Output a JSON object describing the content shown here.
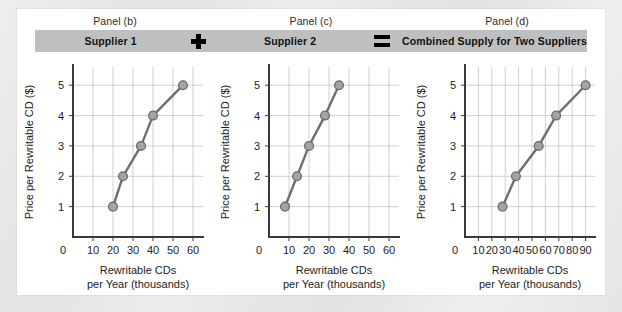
{
  "figure": {
    "panel_captions": [
      "Panel (b)",
      "Panel (c)",
      "Panel (d)"
    ],
    "title_bar": {
      "supplier1_label": "Supplier 1",
      "plus_operator": "+",
      "supplier2_label": "Supplier 2",
      "equals_operator": "=",
      "combined_label": "Combined Supply for Two Suppliers",
      "bar_color": "#bfbfbf"
    },
    "colors": {
      "line": "#6f6f6f",
      "marker_fill": "#a3a3a3",
      "marker_stroke": "#6b6b6b",
      "grid": "#c4c4c4",
      "axis": "#3a3a3a",
      "card_background": "#ffffff",
      "page_background": "#e8e8e8"
    }
  },
  "chart_data": [
    {
      "type": "line",
      "title": "Supplier 1",
      "panel": "Panel (b)",
      "xlabel": "Rewritable CDs per Year (thousands)",
      "xlabel_line1": "Rewritable CDs",
      "xlabel_line2": "per Year (thousands)",
      "ylabel": "Price per Rewritable CD ($)",
      "xlim": [
        0,
        65
      ],
      "ylim": [
        0,
        5.6
      ],
      "xticks": [
        0,
        10,
        20,
        30,
        40,
        50,
        60
      ],
      "xticklabels": [
        "0",
        "10",
        "20",
        "30",
        "40",
        "50",
        "60"
      ],
      "yticks": [
        1,
        2,
        3,
        4,
        5
      ],
      "yticklabels": [
        "1",
        "2",
        "3",
        "4",
        "5"
      ],
      "grid": true,
      "legend": "none",
      "x": [
        20,
        25,
        34,
        40,
        55
      ],
      "y": [
        1,
        2,
        3,
        4,
        5
      ],
      "series": [
        {
          "name": "Supplier 1 supply",
          "values": [
            1,
            2,
            3,
            4,
            5
          ]
        }
      ]
    },
    {
      "type": "line",
      "title": "Supplier 2",
      "panel": "Panel (c)",
      "xlabel": "Rewritable CDs per Year (thousands)",
      "xlabel_line1": "Rewritable CDs",
      "xlabel_line2": "per Year (thousands)",
      "ylabel": "Price per Rewritable CD ($)",
      "xlim": [
        0,
        65
      ],
      "ylim": [
        0,
        5.6
      ],
      "xticks": [
        0,
        10,
        20,
        30,
        40,
        50,
        60
      ],
      "xticklabels": [
        "0",
        "10",
        "20",
        "30",
        "40",
        "50",
        "60"
      ],
      "yticks": [
        1,
        2,
        3,
        4,
        5
      ],
      "yticklabels": [
        "1",
        "2",
        "3",
        "4",
        "5"
      ],
      "grid": true,
      "legend": "none",
      "x": [
        8,
        14,
        20,
        28,
        35
      ],
      "y": [
        1,
        2,
        3,
        4,
        5
      ],
      "series": [
        {
          "name": "Supplier 2 supply",
          "values": [
            1,
            2,
            3,
            4,
            5
          ]
        }
      ]
    },
    {
      "type": "line",
      "title": "Combined Supply for Two Suppliers",
      "panel": "Panel (d)",
      "xlabel": "Rewritable CDs per Year (thousands)",
      "xlabel_line1": "Rewritable CDs",
      "xlabel_line2": "per Year (thousands)",
      "ylabel": "Price per Rewritable CD ($)",
      "xlim": [
        0,
        97
      ],
      "ylim": [
        0,
        5.6
      ],
      "xticks": [
        0,
        10,
        20,
        30,
        40,
        50,
        60,
        70,
        80,
        90
      ],
      "xticklabels": [
        "0",
        "10",
        "20",
        "30",
        "40",
        "50",
        "60",
        "70",
        "80",
        "90"
      ],
      "yticks": [
        1,
        2,
        3,
        4,
        5
      ],
      "yticklabels": [
        "1",
        "2",
        "3",
        "4",
        "5"
      ],
      "grid": true,
      "legend": "none",
      "x": [
        28,
        38,
        55,
        68,
        90
      ],
      "y": [
        1,
        2,
        3,
        4,
        5
      ],
      "series": [
        {
          "name": "Combined supply",
          "values": [
            1,
            2,
            3,
            4,
            5
          ]
        }
      ]
    }
  ]
}
